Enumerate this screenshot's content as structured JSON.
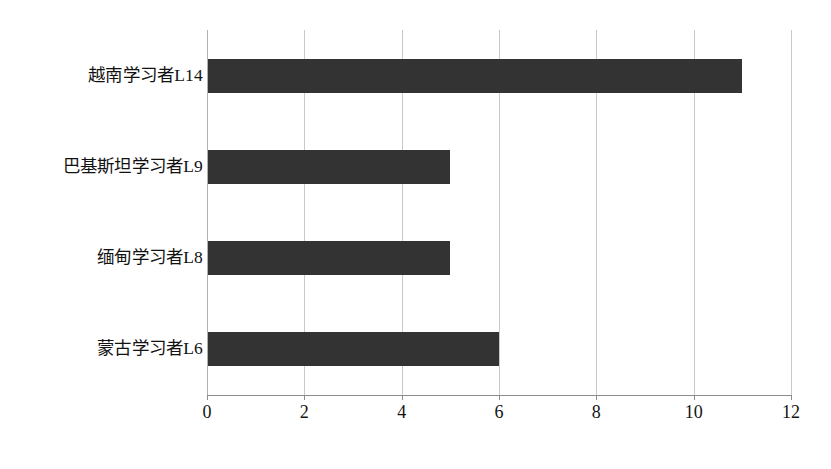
{
  "chart_data": {
    "type": "bar",
    "orientation": "horizontal",
    "title": "",
    "subtitle": "",
    "xlabel": "",
    "ylabel": "",
    "categories": [
      "越南学习者L14",
      "巴基斯坦学习者L9",
      "缅甸学习者L8",
      "蒙古学习者L6"
    ],
    "values": [
      11,
      5,
      5,
      6
    ],
    "xlim": [
      0,
      12
    ],
    "xticks": [
      0,
      2,
      4,
      6,
      8,
      10,
      12
    ],
    "xtick_labels": [
      "0",
      "2",
      "4",
      "6",
      "8",
      "10",
      "12"
    ],
    "grid": "vertical",
    "legend": "none",
    "bar_color": "#333333",
    "gridline_color": "#c9c9c9",
    "axis_color": "#8c8c8c",
    "background_color": "#ffffff"
  }
}
